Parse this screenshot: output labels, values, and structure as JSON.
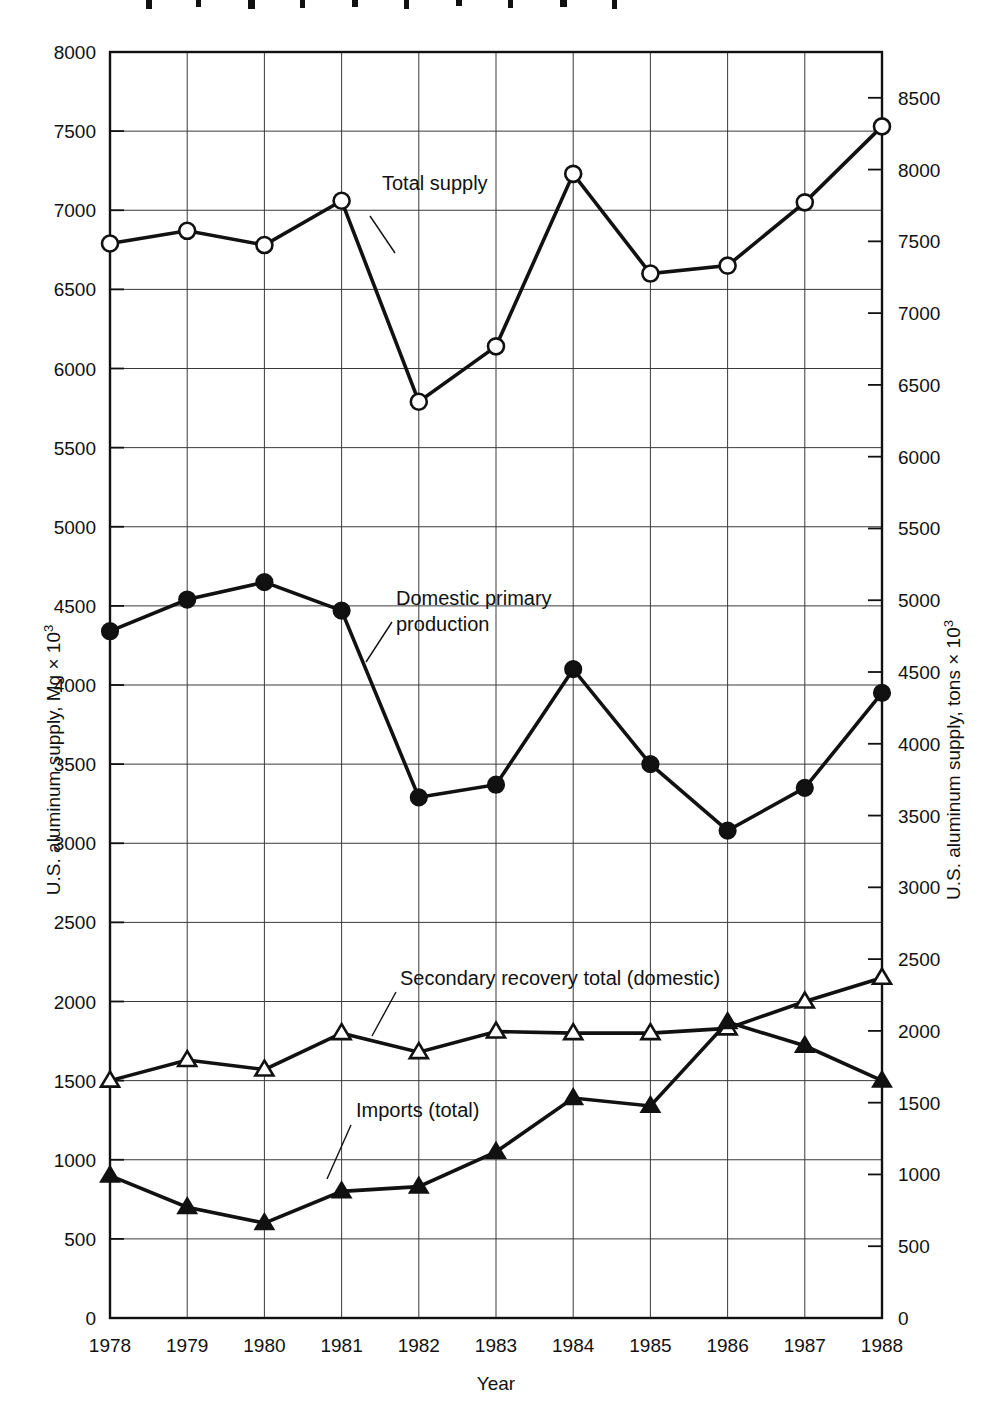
{
  "figure": {
    "partial_title_top": "",
    "background_color": "#ffffff",
    "line_color": "#111111"
  },
  "axes": {
    "x": {
      "title": "Year",
      "ticks": [
        "1978",
        "1979",
        "1980",
        "1981",
        "1982",
        "1983",
        "1984",
        "1985",
        "1986",
        "1987",
        "1988"
      ]
    },
    "y_left": {
      "title": "U.S. aluminum supply, Mg × 10",
      "title_exponent": "3",
      "ticks": [
        "0",
        "500",
        "1000",
        "1500",
        "2000",
        "2500",
        "3000",
        "3500",
        "4000",
        "4500",
        "5000",
        "5500",
        "6000",
        "6500",
        "7000",
        "7500",
        "8000"
      ]
    },
    "y_right": {
      "title": "U.S. aluminum supply, tons × 10",
      "title_exponent": "3",
      "ticks": [
        "0",
        "500",
        "1000",
        "1500",
        "2000",
        "2500",
        "3000",
        "3500",
        "4000",
        "4500",
        "5000",
        "5500",
        "6000",
        "6500",
        "7000",
        "7500",
        "8000",
        "8500"
      ]
    }
  },
  "annotations": [
    {
      "id": "total-supply",
      "label": "Total supply"
    },
    {
      "id": "domestic-primary-production",
      "label_line1": "Domestic primary",
      "label_line2": "production"
    },
    {
      "id": "secondary-recovery",
      "label": "Secondary recovery total (domestic)"
    },
    {
      "id": "imports",
      "label": "Imports (total)"
    }
  ],
  "chart_data": {
    "type": "line",
    "title": "",
    "xlabel": "Year",
    "ylabel": "U.S. aluminum supply, Mg × 10³",
    "ylabel_secondary": "U.S. aluminum supply, tons × 10³",
    "x": [
      1978,
      1979,
      1980,
      1981,
      1982,
      1983,
      1984,
      1985,
      1986,
      1987,
      1988
    ],
    "categories": [
      "1978",
      "1979",
      "1980",
      "1981",
      "1982",
      "1983",
      "1984",
      "1985",
      "1986",
      "1987",
      "1988"
    ],
    "ylim": [
      0,
      8000
    ],
    "ylim_secondary": [
      0,
      8819
    ],
    "ytick_step": 500,
    "ytick_step_secondary": 500,
    "grid": true,
    "legend": "inline-annotations",
    "series": [
      {
        "name": "Total supply",
        "marker": "open-circle",
        "values": [
          6790,
          6870,
          6780,
          7060,
          5790,
          6140,
          7230,
          6600,
          6650,
          7050,
          7530
        ]
      },
      {
        "name": "Domestic primary production",
        "marker": "filled-circle",
        "values": [
          4340,
          4540,
          4650,
          4470,
          3290,
          3370,
          4100,
          3500,
          3080,
          3350,
          3950
        ]
      },
      {
        "name": "Secondary recovery total (domestic)",
        "marker": "open-triangle",
        "values": [
          1500,
          1630,
          1570,
          1800,
          1680,
          1810,
          1800,
          1800,
          1830,
          2000,
          2150
        ]
      },
      {
        "name": "Imports (total)",
        "marker": "filled-triangle",
        "values": [
          900,
          700,
          600,
          800,
          830,
          1050,
          1390,
          1340,
          1870,
          1720,
          1500
        ]
      }
    ]
  }
}
